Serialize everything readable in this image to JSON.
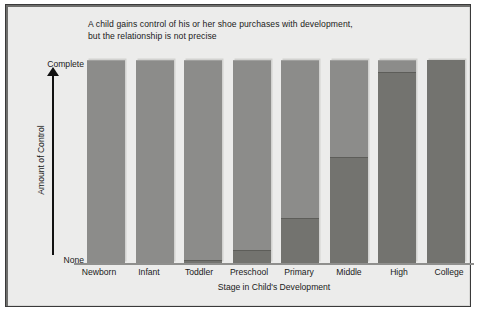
{
  "chart_data": {
    "type": "bar",
    "title": "A child gains control of his or her shoe purchases with development, but the relationship is not precise",
    "title_lines": [
      "A child gains control of his or her shoe purchases with development,",
      "but the relationship is not precise"
    ],
    "xlabel": "Stage in Child's Development",
    "ylabel": "Amount of Control",
    "categories": [
      "Newborn",
      "Infant",
      "Toddler",
      "Preschool",
      "Primary",
      "Middle",
      "High",
      "College"
    ],
    "y_tick_labels": [
      "None",
      "Complete"
    ],
    "ylim": [
      0,
      100
    ],
    "grid": false,
    "legend": "none",
    "stacked": true,
    "series": [
      {
        "name": "Child control",
        "color": "#73736f",
        "values": [
          0,
          0,
          1.5,
          6.5,
          22,
          52,
          94,
          100
        ]
      },
      {
        "name": "Parent control",
        "color": "#8c8c8a",
        "values": [
          100,
          100,
          98.5,
          93.5,
          78,
          48,
          6,
          0
        ]
      }
    ]
  },
  "axes": {
    "y_top_label": "Complete",
    "y_bottom_label": "None",
    "y_title": "Amount of Control",
    "x_title": "Stage in Child's Development"
  }
}
